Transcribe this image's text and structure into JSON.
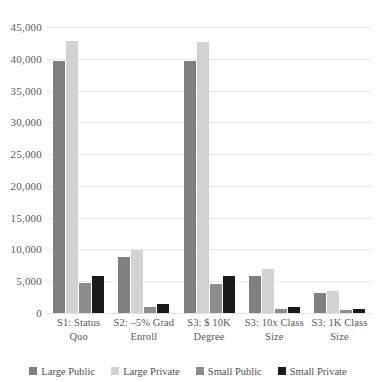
{
  "chart_data": {
    "type": "bar",
    "title": "",
    "xlabel": "",
    "ylabel": "",
    "ylim": [
      0,
      45000
    ],
    "ytick_labels": [
      "45,000",
      "40,000",
      "35,000",
      "30,000",
      "25,000",
      "20,000",
      "15,000",
      "10,000",
      "5,000",
      "0"
    ],
    "ytick_values": [
      45000,
      40000,
      35000,
      30000,
      25000,
      20000,
      15000,
      10000,
      5000,
      0
    ],
    "grid": true,
    "legend_position": "bottom",
    "categories": [
      "S1: Status Quo",
      "S2: –5% Grad Enroll",
      "S3: $ 10K Degree",
      "S3: 10x Class Size",
      "S3: 1K Class Size"
    ],
    "category_lines": [
      [
        "S1: Status",
        "Quo"
      ],
      [
        "S2: –5% Grad",
        "Enroll"
      ],
      [
        "S3: $ 10K",
        "Degree"
      ],
      [
        "S3: 10x Class",
        "Size"
      ],
      [
        "S3: 1K Class",
        "Size"
      ]
    ],
    "series": [
      {
        "name": "Large Public",
        "color": "#808080",
        "values": [
          39700,
          8800,
          39700,
          5800,
          3200
        ]
      },
      {
        "name": "Large Private",
        "color": "#d2d2d2",
        "values": [
          42800,
          9900,
          42700,
          6900,
          3500
        ]
      },
      {
        "name": "Small Public",
        "color": "#8d8d8d",
        "values": [
          4700,
          1000,
          4600,
          600,
          400
        ]
      },
      {
        "name": "Small Private",
        "color": "#1a1a1a",
        "values": [
          5900,
          1400,
          5800,
          900,
          600
        ]
      }
    ]
  }
}
